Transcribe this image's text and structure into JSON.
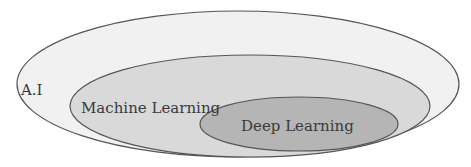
{
  "diagram": {
    "type": "nested-ellipses (euler diagram)",
    "sets": [
      {
        "label": "A.I",
        "fill": "#f1f1f1",
        "stroke": "#555555",
        "cx": 238,
        "cy": 84,
        "rx": 221,
        "ry": 73,
        "label_x": 21,
        "label_y": 95
      },
      {
        "label": "Machine Learning",
        "fill": "#d9d9d9",
        "stroke": "#555555",
        "cx": 250,
        "cy": 106,
        "rx": 180,
        "ry": 51,
        "label_x": 81,
        "label_y": 113
      },
      {
        "label": "Deep Learning",
        "fill": "#b5b5b5",
        "stroke": "#555555",
        "cx": 299,
        "cy": 124,
        "rx": 99,
        "ry": 27,
        "label_x": 241,
        "label_y": 131
      }
    ],
    "relationship": "Deep Learning ⊂ Machine Learning ⊂ A.I"
  }
}
